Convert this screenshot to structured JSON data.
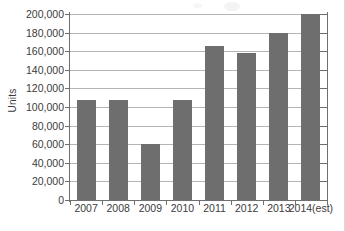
{
  "chart_data": {
    "type": "bar",
    "title": "",
    "subtitle": "",
    "xlabel": "",
    "ylabel": "Units",
    "categories": [
      "2007",
      "2008",
      "2009",
      "2010",
      "2011",
      "2012",
      "2013",
      "2014(est)"
    ],
    "values": [
      108000,
      108000,
      60000,
      108000,
      166000,
      158000,
      180000,
      200000
    ],
    "ylim": [
      0,
      200000
    ],
    "ytick_step": 20000,
    "ytick_labels": [
      "200,000",
      "180,000",
      "160,000",
      "140,000",
      "120,000",
      "100,000",
      "80,000",
      "60,000",
      "40,000",
      "20,000",
      "0"
    ],
    "ytick_values": [
      200000,
      180000,
      160000,
      140000,
      120000,
      100000,
      80000,
      60000,
      40000,
      20000,
      0
    ],
    "grid": true,
    "grid_axis": "y",
    "legend": false,
    "legend_position": "none",
    "bar_color": "#6e6e6e",
    "grid_color": "#b4b4b4",
    "axis_color": "#6f6f6f",
    "background_color": "#ffffff",
    "orientation": "vertical"
  }
}
